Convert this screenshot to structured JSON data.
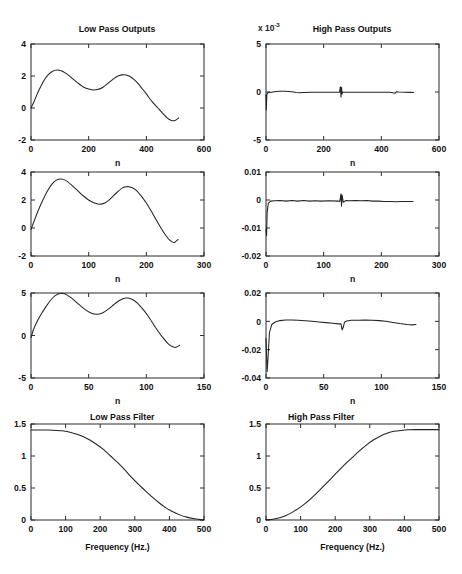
{
  "figure": {
    "background": "#ffffff",
    "line_color": "#232323",
    "axis_color": "#2b2b2b",
    "width": 462,
    "height": 574,
    "rows": 4,
    "cols": 2
  },
  "chart_data": [
    {
      "id": "low-pass-outputs",
      "type": "line",
      "title": "Low Pass Outputs",
      "xlabel": "n",
      "ylabel": "",
      "xlim": [
        0,
        600
      ],
      "ylim": [
        -2,
        4
      ],
      "xticks": [
        0,
        200,
        400,
        600
      ],
      "xticklabels": [
        "0",
        "200",
        "400",
        "600"
      ],
      "yticks": [
        -2,
        0,
        2,
        4
      ],
      "yticklabels": [
        "-2",
        "0",
        "2",
        "4"
      ],
      "grid": false,
      "legend": null,
      "series": [
        {
          "name": "lowpass output",
          "x": [
            0,
            10,
            20,
            30,
            45,
            60,
            75,
            90,
            105,
            120,
            140,
            160,
            180,
            200,
            215,
            230,
            250,
            270,
            285,
            300,
            315,
            325,
            340,
            355,
            370,
            385,
            400,
            420,
            440,
            455,
            470,
            485,
            500,
            512
          ],
          "y": [
            0.0,
            0.38,
            0.82,
            1.2,
            1.72,
            2.08,
            2.3,
            2.38,
            2.33,
            2.18,
            1.9,
            1.6,
            1.33,
            1.18,
            1.13,
            1.15,
            1.3,
            1.58,
            1.8,
            1.98,
            2.07,
            2.08,
            2.0,
            1.82,
            1.55,
            1.22,
            0.88,
            0.4,
            0.0,
            -0.3,
            -0.58,
            -0.76,
            -0.78,
            -0.62
          ]
        }
      ]
    },
    {
      "id": "high-pass-outputs",
      "type": "line",
      "title": "High Pass Outputs",
      "exponent_label": "x 10",
      "exponent_value": "-3",
      "xlabel": "n",
      "ylabel": "",
      "xlim": [
        0,
        600
      ],
      "ylim": [
        -5,
        5
      ],
      "xticks": [
        0,
        200,
        400,
        600
      ],
      "xticklabels": [
        "0",
        "200",
        "400",
        "600"
      ],
      "yticks": [
        -5,
        0,
        5
      ],
      "yticklabels": [
        "-5",
        "0",
        "5"
      ],
      "grid": false,
      "legend": null,
      "series": [
        {
          "name": "highpass output",
          "x": [
            0,
            1,
            3,
            6,
            10,
            20,
            35,
            50,
            65,
            80,
            95,
            105,
            115,
            130,
            160,
            200,
            240,
            255,
            258,
            260,
            262,
            264,
            266,
            270,
            290,
            320,
            360,
            400,
            430,
            448,
            452,
            460,
            480,
            500,
            512
          ],
          "y": [
            -0.3,
            -1.85,
            -0.25,
            -0.08,
            -0.04,
            -0.02,
            0.05,
            0.08,
            0.08,
            0.05,
            0.0,
            -0.05,
            -0.07,
            -0.05,
            -0.03,
            -0.02,
            -0.02,
            -0.02,
            0.55,
            -0.55,
            0.5,
            -0.2,
            -0.03,
            -0.02,
            -0.02,
            -0.02,
            -0.02,
            -0.02,
            -0.03,
            -0.12,
            0.02,
            0.0,
            -0.02,
            -0.04,
            -0.06
          ]
        }
      ]
    },
    {
      "id": "low-pass-outputs-2",
      "type": "line",
      "title": "",
      "xlabel": "n",
      "ylabel": "",
      "xlim": [
        0,
        300
      ],
      "ylim": [
        -2,
        4
      ],
      "xticks": [
        0,
        100,
        200,
        300
      ],
      "xticklabels": [
        "0",
        "100",
        "200",
        "300"
      ],
      "yticks": [
        -2,
        0,
        2,
        4
      ],
      "yticklabels": [
        "-2",
        "0",
        "2",
        "4"
      ],
      "grid": false,
      "legend": null,
      "series": [
        {
          "name": "lowpass output half rate",
          "x": [
            0,
            5,
            12,
            20,
            28,
            36,
            44,
            52,
            60,
            70,
            80,
            90,
            100,
            110,
            118,
            128,
            138,
            148,
            158,
            165,
            172,
            180,
            190,
            200,
            210,
            220,
            230,
            240,
            248,
            255
          ],
          "y": [
            -0.1,
            0.45,
            1.2,
            1.95,
            2.6,
            3.12,
            3.42,
            3.5,
            3.4,
            3.08,
            2.7,
            2.32,
            2.0,
            1.78,
            1.7,
            1.78,
            2.1,
            2.5,
            2.85,
            2.95,
            2.93,
            2.78,
            2.35,
            1.78,
            1.1,
            0.38,
            -0.3,
            -0.85,
            -1.05,
            -0.82
          ]
        }
      ]
    },
    {
      "id": "high-pass-outputs-2",
      "type": "line",
      "title": "",
      "xlabel": "n",
      "ylabel": "",
      "xlim": [
        0,
        300
      ],
      "ylim": [
        -0.02,
        0.01
      ],
      "xticks": [
        0,
        100,
        200,
        300
      ],
      "xticklabels": [
        "0",
        "100",
        "200",
        "300"
      ],
      "yticks": [
        -0.02,
        -0.01,
        0,
        0.01
      ],
      "yticklabels": [
        "-0.02",
        "-0.01",
        "0",
        "0.01"
      ],
      "grid": false,
      "legend": null,
      "series": [
        {
          "name": "highpass output half rate",
          "x": [
            0,
            1,
            2,
            4,
            8,
            15,
            25,
            35,
            45,
            55,
            65,
            75,
            85,
            95,
            110,
            125,
            128,
            130,
            131,
            132,
            134,
            138,
            145,
            155,
            165,
            175,
            185,
            195,
            205,
            215,
            225,
            235,
            245,
            255
          ],
          "y": [
            -0.0105,
            -0.0128,
            -0.0045,
            -0.0012,
            -0.0004,
            -0.0003,
            -0.0002,
            -0.0004,
            -0.0002,
            -0.0004,
            -0.0002,
            -0.0004,
            -0.0003,
            -0.0004,
            -0.0003,
            -0.0004,
            -0.0005,
            0.0022,
            -0.0022,
            0.0018,
            -0.0008,
            -0.0002,
            -0.0003,
            -0.0002,
            -0.0003,
            -0.0002,
            -0.0004,
            -0.0004,
            -0.0005,
            -0.0005,
            -0.0006,
            -0.0005,
            -0.0005,
            -0.0005
          ]
        }
      ]
    },
    {
      "id": "low-pass-outputs-3",
      "type": "line",
      "title": "",
      "xlabel": "n",
      "ylabel": "",
      "xlim": [
        0,
        150
      ],
      "ylim": [
        -5,
        5
      ],
      "xticks": [
        0,
        50,
        100,
        150
      ],
      "xticklabels": [
        "0",
        "50",
        "100",
        "150"
      ],
      "yticks": [
        -5,
        0,
        5
      ],
      "yticklabels": [
        "-5",
        "0",
        "5"
      ],
      "grid": false,
      "legend": null,
      "series": [
        {
          "name": "lowpass output quarter rate",
          "x": [
            0,
            2,
            5,
            9,
            13,
            17,
            21,
            25,
            29,
            33,
            37,
            42,
            47,
            52,
            57,
            62,
            67,
            72,
            77,
            82,
            87,
            92,
            97,
            102,
            108,
            114,
            120,
            125,
            129
          ],
          "y": [
            -0.25,
            0.65,
            1.55,
            2.55,
            3.4,
            4.15,
            4.7,
            4.95,
            4.9,
            4.6,
            4.2,
            3.6,
            3.05,
            2.65,
            2.5,
            2.65,
            3.1,
            3.65,
            4.15,
            4.4,
            4.3,
            3.85,
            3.1,
            2.2,
            0.95,
            -0.2,
            -1.1,
            -1.4,
            -1.15
          ]
        }
      ]
    },
    {
      "id": "high-pass-outputs-3",
      "type": "line",
      "title": "",
      "xlabel": "n",
      "ylabel": "",
      "xlim": [
        0,
        150
      ],
      "ylim": [
        -0.04,
        0.02
      ],
      "xticks": [
        0,
        50,
        100,
        150
      ],
      "xticklabels": [
        "0",
        "50",
        "100",
        "150"
      ],
      "yticks": [
        -0.04,
        -0.02,
        0,
        0.02
      ],
      "yticklabels": [
        "-0.04",
        "-0.02",
        "0",
        "0.02"
      ],
      "grid": false,
      "legend": null,
      "series": [
        {
          "name": "highpass output quarter rate",
          "x": [
            0,
            1,
            2,
            3,
            5,
            8,
            12,
            17,
            22,
            28,
            34,
            40,
            46,
            52,
            58,
            63,
            65,
            66,
            67,
            68,
            70,
            74,
            80,
            86,
            92,
            98,
            104,
            110,
            116,
            122,
            127,
            130
          ],
          "y": [
            -0.012,
            -0.0355,
            -0.0225,
            -0.008,
            -0.0022,
            -0.0005,
            0.0005,
            0.0009,
            0.0009,
            0.0007,
            0.0004,
            0.0,
            -0.0004,
            -0.0009,
            -0.0014,
            -0.0018,
            -0.0018,
            -0.006,
            -0.0042,
            -0.0007,
            0.0003,
            0.0007,
            0.0008,
            0.0009,
            0.0008,
            0.0005,
            0.0,
            -0.0008,
            -0.0016,
            -0.0022,
            -0.0025,
            -0.0022
          ]
        }
      ]
    },
    {
      "id": "low-pass-filter",
      "type": "line",
      "title": "Low Pass Filter",
      "xlabel": "Frequency (Hz.)",
      "ylabel": "",
      "xlim": [
        0,
        500
      ],
      "ylim": [
        0,
        1.5
      ],
      "xticks": [
        0,
        100,
        200,
        300,
        400,
        500
      ],
      "xticklabels": [
        "0",
        "100",
        "200",
        "300",
        "400",
        "500"
      ],
      "yticks": [
        0,
        0.5,
        1,
        1.5
      ],
      "yticklabels": [
        "0",
        "0.5",
        "1",
        "1.5"
      ],
      "grid": false,
      "legend": null,
      "series": [
        {
          "name": "low pass magnitude response",
          "x": [
            0,
            25,
            50,
            75,
            90,
            110,
            130,
            150,
            170,
            190,
            210,
            230,
            250,
            270,
            290,
            310,
            330,
            350,
            370,
            390,
            410,
            430,
            450,
            470,
            490,
            500
          ],
          "y": [
            1.405,
            1.405,
            1.405,
            1.4,
            1.395,
            1.375,
            1.345,
            1.305,
            1.25,
            1.18,
            1.1,
            1.0,
            0.9,
            0.79,
            0.67,
            0.56,
            0.46,
            0.36,
            0.27,
            0.19,
            0.13,
            0.08,
            0.045,
            0.022,
            0.006,
            0.0
          ]
        }
      ]
    },
    {
      "id": "high-pass-filter",
      "type": "line",
      "title": "High Pass Filter",
      "xlabel": "Frequency (Hz.)",
      "ylabel": "",
      "xlim": [
        0,
        500
      ],
      "ylim": [
        0,
        1.5
      ],
      "xticks": [
        0,
        100,
        200,
        300,
        400,
        500
      ],
      "xticklabels": [
        "0",
        "100",
        "200",
        "300",
        "400",
        "500"
      ],
      "yticks": [
        0,
        0.5,
        1,
        1.5
      ],
      "yticklabels": [
        "0",
        "0.5",
        "1",
        "1.5"
      ],
      "grid": false,
      "legend": null,
      "series": [
        {
          "name": "high pass magnitude response",
          "x": [
            0,
            20,
            40,
            60,
            80,
            95,
            110,
            130,
            150,
            170,
            190,
            210,
            230,
            250,
            270,
            290,
            310,
            330,
            350,
            370,
            390,
            410,
            430,
            450,
            475,
            500
          ],
          "y": [
            0.005,
            0.012,
            0.035,
            0.075,
            0.135,
            0.185,
            0.245,
            0.335,
            0.44,
            0.55,
            0.66,
            0.77,
            0.88,
            0.98,
            1.08,
            1.17,
            1.25,
            1.31,
            1.355,
            1.385,
            1.4,
            1.41,
            1.412,
            1.412,
            1.412,
            1.412
          ]
        }
      ]
    }
  ]
}
